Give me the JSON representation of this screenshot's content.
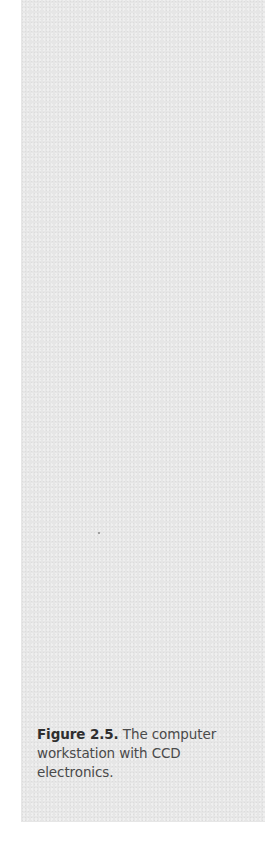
{
  "figure": {
    "label": "Figure 2.5.",
    "caption_text": " The computer workstation with CCD electronics."
  },
  "colors": {
    "panel_background": "#e6e6e6",
    "page_background": "#ffffff",
    "caption_text": "#4a4a4a"
  }
}
